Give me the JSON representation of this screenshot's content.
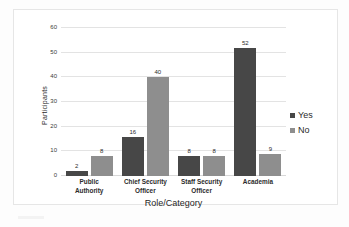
{
  "chart_data": {
    "type": "bar",
    "title": "",
    "xlabel": "Role/Category",
    "ylabel": "Participants",
    "categories": [
      "Public Authority",
      "Chief Security Officer",
      "Staff Security Officer",
      "Academia"
    ],
    "category_lines": [
      [
        "Public",
        "Authority"
      ],
      [
        "Chief Security",
        "Officer"
      ],
      [
        "Staff Security",
        "Officer"
      ],
      [
        "Academia"
      ]
    ],
    "series": [
      {
        "name": "Yes",
        "values": [
          2,
          16,
          8,
          52
        ],
        "color": "#474747"
      },
      {
        "name": "No",
        "values": [
          8,
          40,
          8,
          9
        ],
        "color": "#8e8e8e"
      }
    ],
    "yticks": [
      0,
      10,
      20,
      30,
      40,
      50,
      60
    ],
    "ylim": [
      0,
      60
    ],
    "grid": true,
    "legend_position": "right",
    "data_labels": true
  },
  "legend": {
    "items": [
      {
        "label": "Yes"
      },
      {
        "label": "No"
      }
    ]
  }
}
